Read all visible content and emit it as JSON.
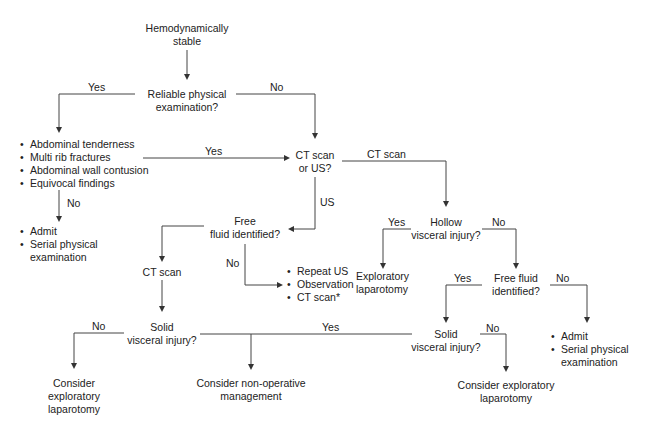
{
  "nodes": {
    "start": "Hemodynamically\nstable",
    "reliable_exam": "Reliable physical\nexamination?",
    "findings": [
      "Abdominal tenderness",
      "Multi rib fractures",
      "Abdominal wall contusion",
      "Equivocal findings"
    ],
    "admit_left": [
      "Admit",
      "Serial physical examination"
    ],
    "ct_or_us": "CT scan\nor US?",
    "free_fluid_us": "Free\nfluid identified?",
    "repeat_list": [
      "Repeat US",
      "Observation",
      "CT scan*"
    ],
    "ct_scan_box": "CT scan",
    "solid_left": "Solid\nvisceral injury?",
    "consider_expl_left": "Consider\nexploratory\nlaparotomy",
    "consider_nonop": "Consider non-operative\nmanagement",
    "hollow": "Hollow\nvisceral injury?",
    "expl_lap": "Exploratory\nlaparotomy",
    "free_fluid_ct": "Free fluid\nidentified?",
    "solid_right": "Solid\nvisceral injury?",
    "consider_expl_right": "Consider exploratory\nlaparotomy",
    "admit_right": [
      "Admit",
      "Serial physical examination"
    ]
  },
  "edge_labels": {
    "reliable_yes": "Yes",
    "reliable_no": "No",
    "findings_yes": "Yes",
    "findings_no": "No",
    "ct_branch": "CT scan",
    "us_branch": "US",
    "free_fluid_no": "No",
    "solid_left_no": "No",
    "solid_left_yes": "Yes",
    "hollow_yes": "Yes",
    "hollow_no": "No",
    "ffct_yes": "Yes",
    "ffct_no": "No",
    "solid_right_no": "No"
  }
}
